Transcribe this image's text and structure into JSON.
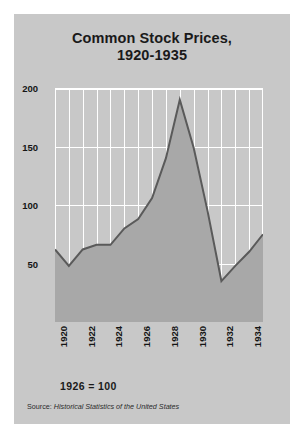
{
  "figure": {
    "background_color": "#c8c8c8",
    "page_color": "#ffffff"
  },
  "title": {
    "line1": "Common Stock Prices,",
    "line2": "1920-1935"
  },
  "footnote": {
    "base": "1926 = 100"
  },
  "source": {
    "prefix": "Source:",
    "title": " Historical Statistics of the United States"
  },
  "chart_data": {
    "type": "area",
    "title": "Common Stock Prices, 1920-1935",
    "subtitle": "",
    "xlabel": "",
    "ylabel": "",
    "xlim": [
      1920,
      1935
    ],
    "ylim": [
      0,
      200
    ],
    "yticks": [
      50,
      100,
      150,
      200
    ],
    "ytick_labels": [
      "50",
      "100",
      "150",
      "200"
    ],
    "xticks": [
      1920,
      1922,
      1924,
      1926,
      1928,
      1930,
      1932,
      1934
    ],
    "xtick_labels": [
      "1920",
      "1922",
      "1924",
      "1926",
      "1928",
      "1930",
      "1932",
      "1934"
    ],
    "xtick_rotation": 90,
    "grid": true,
    "grid_color": "#ffffff",
    "grid_axis": "both",
    "legend": false,
    "legend_position": "none",
    "line_color": "#5a5a5a",
    "fill_color": "#a8a8a8",
    "x": [
      1920,
      1921,
      1922,
      1923,
      1924,
      1925,
      1926,
      1927,
      1928,
      1929,
      1930,
      1931,
      1932,
      1933,
      1934,
      1935
    ],
    "values": [
      62,
      48,
      62,
      66,
      66,
      80,
      88,
      106,
      140,
      190,
      149,
      95,
      35,
      48,
      60,
      75
    ],
    "series": [
      {
        "name": "Common stock prices (1926 = 100)",
        "values": [
          62,
          48,
          62,
          66,
          66,
          80,
          88,
          106,
          140,
          190,
          149,
          95,
          35,
          48,
          60,
          75
        ]
      }
    ],
    "annotations": [
      "1926 = 100"
    ]
  }
}
